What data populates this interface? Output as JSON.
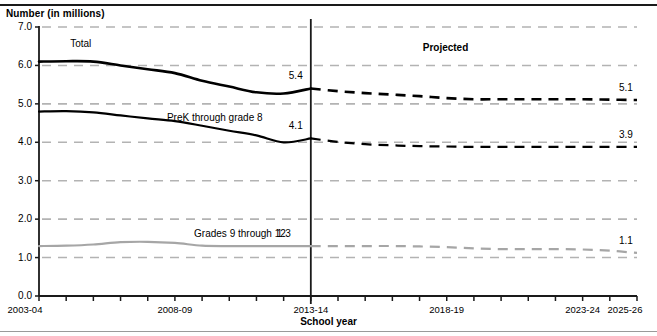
{
  "figure": {
    "y_axis_title": "Number (in millions)",
    "x_axis_title": "School year",
    "projected_label": "Projected"
  },
  "series_labels": {
    "total": "Total",
    "prek8": "PreK through grade 8",
    "grades912": "Grades 9 through 12"
  },
  "endpoint_labels": {
    "total_2013": "5.4",
    "total_2025": "5.1",
    "prek8_2013": "4.1",
    "prek8_2025": "3.9",
    "grades912_2013": "1.3",
    "grades912_2025": "1.1"
  },
  "colors": {
    "total_line": "#000000",
    "prek8_line": "#000000",
    "grades912_line": "#a6a6a6",
    "gridline": "#b3b3b3",
    "axis": "#1a1a1a",
    "divider": "#1a1a1a"
  },
  "chart_data": {
    "type": "line",
    "title": "",
    "xlabel": "School year",
    "ylabel": "Number (in millions)",
    "ylim": [
      0.0,
      7.0
    ],
    "ytick_labels": [
      "0.0",
      "1.0",
      "2.0",
      "3.0",
      "4.0",
      "5.0",
      "6.0",
      "7.0"
    ],
    "ytick_values": [
      0.0,
      1.0,
      2.0,
      3.0,
      4.0,
      5.0,
      6.0,
      7.0
    ],
    "grid": "horizontal-dashed",
    "legend": "inline-annotations",
    "x": [
      "2003-04",
      "2004-05",
      "2005-06",
      "2006-07",
      "2007-08",
      "2008-09",
      "2009-10",
      "2010-11",
      "2011-12",
      "2012-13",
      "2013-14",
      "2014-15",
      "2015-16",
      "2016-17",
      "2017-18",
      "2018-19",
      "2019-20",
      "2020-21",
      "2021-22",
      "2022-23",
      "2023-24",
      "2024-25",
      "2025-26"
    ],
    "xtick_labels_shown": [
      "2003-04",
      "2008-09",
      "2013-14",
      "2018-19",
      "2023-24",
      "2025-26"
    ],
    "projection_start": "2013-14",
    "series": [
      {
        "name": "Total",
        "style": "solid-then-dashed",
        "color": "#000000",
        "values": [
          6.1,
          6.11,
          6.1,
          6.0,
          5.9,
          5.8,
          5.6,
          5.45,
          5.3,
          5.27,
          5.4,
          5.33,
          5.28,
          5.24,
          5.2,
          5.15,
          5.12,
          5.12,
          5.12,
          5.12,
          5.12,
          5.11,
          5.1
        ]
      },
      {
        "name": "PreK through grade 8",
        "style": "solid-then-dashed",
        "color": "#000000",
        "values": [
          4.8,
          4.81,
          4.78,
          4.7,
          4.62,
          4.55,
          4.43,
          4.3,
          4.18,
          4.0,
          4.1,
          4.01,
          3.95,
          3.92,
          3.9,
          3.89,
          3.88,
          3.88,
          3.88,
          3.88,
          3.88,
          3.88,
          3.88
        ]
      },
      {
        "name": "Grades 9 through 12",
        "style": "solid-then-dashed",
        "color": "#a6a6a6",
        "values": [
          1.3,
          1.31,
          1.34,
          1.4,
          1.41,
          1.38,
          1.31,
          1.3,
          1.3,
          1.3,
          1.3,
          1.3,
          1.3,
          1.3,
          1.29,
          1.27,
          1.24,
          1.22,
          1.22,
          1.22,
          1.21,
          1.18,
          1.12
        ]
      }
    ],
    "annotations": [
      {
        "text": "Projected",
        "x": "2018-19",
        "y": 6.45
      },
      {
        "text": "Total",
        "x": "2004-05",
        "y": 6.55
      },
      {
        "text": "PreK through grade 8",
        "x": "2008-09",
        "y": 4.62
      },
      {
        "text": "Grades 9 through 12",
        "x": "2009-10",
        "y": 1.62
      },
      {
        "text": "5.4",
        "x": "2013-14",
        "y": 5.72
      },
      {
        "text": "4.1",
        "x": "2013-14",
        "y": 4.42
      },
      {
        "text": "1.3",
        "x": "2013-14",
        "y": 1.62
      },
      {
        "text": "5.1",
        "x": "2025-26",
        "y": 5.42
      },
      {
        "text": "3.9",
        "x": "2025-26",
        "y": 4.18
      },
      {
        "text": "1.1",
        "x": "2025-26",
        "y": 1.42
      }
    ]
  }
}
